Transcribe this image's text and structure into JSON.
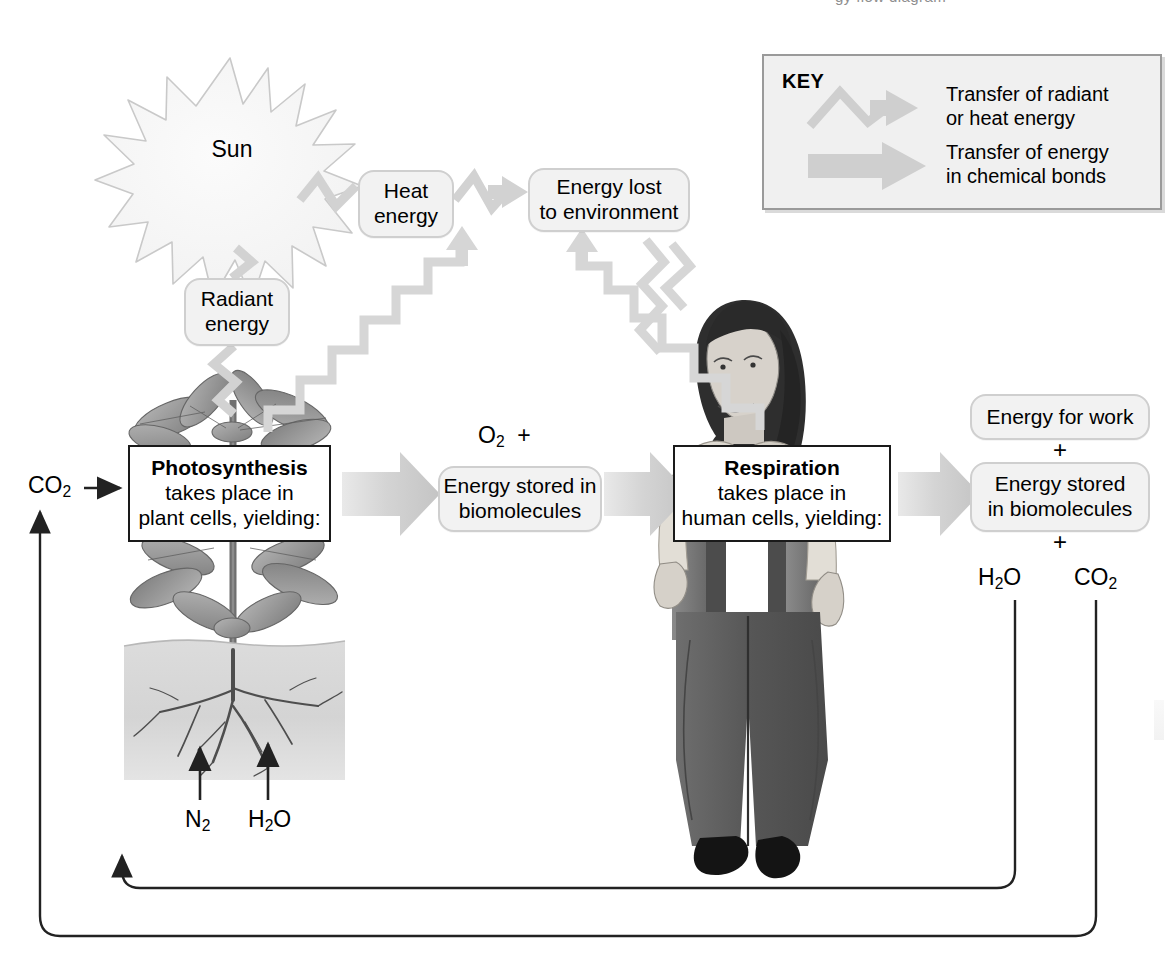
{
  "figure": {
    "title_remnant": "gy flow diagram",
    "bg_color": "#ffffff"
  },
  "key": {
    "title": "KEY",
    "entries": [
      {
        "icon": "zigzag-arrow-icon",
        "label_line1": "Transfer of radiant",
        "label_line2": "or heat energy"
      },
      {
        "icon": "block-arrow-icon",
        "label_line1": "Transfer of energy",
        "label_line2": "in chemical bonds"
      }
    ],
    "panel_color": "#f0f0f0",
    "border_color": "#9a9a9a"
  },
  "nodes": {
    "sun": "Sun",
    "radiant_energy": "Radiant\nenergy",
    "heat_energy_l1": "Heat",
    "heat_energy_l2": "energy",
    "energy_lost_l1": "Energy lost",
    "energy_lost_l2": "to environment",
    "photosynthesis_title": "Photosynthesis",
    "photosynthesis_l2": "takes place in",
    "photosynthesis_l3": "plant cells, yielding:",
    "respiration_title": "Respiration",
    "respiration_l2": "takes place in",
    "respiration_l3": "human cells, yielding:",
    "stored_mid_l1": "Energy stored in",
    "stored_mid_l2": "biomolecules",
    "energy_for_work": "Energy for work",
    "stored_right_l1": "Energy stored",
    "stored_right_l2": "in biomolecules"
  },
  "labels": {
    "co2_input": "CO2",
    "o2_plus": "O2  +",
    "n2_soil": "N2",
    "h2o_soil": "H2O",
    "h2o_output": "H2O",
    "co2_output": "CO2",
    "plus_upper": "+",
    "plus_lower": "+"
  },
  "illustrations": {
    "plant": "plant-illustration",
    "soil": "soil-block-illustration",
    "person": "woman-illustration"
  },
  "colors": {
    "rounded_fill": "#f2f2f2",
    "rounded_stroke": "#cfcfcf",
    "hard_stroke": "#1a1a1a",
    "arrow_gray": "#d2d2d2",
    "zigzag_gray": "#d6d6d6",
    "line_black": "#222222",
    "soil_gray": "#d9d9d9",
    "leaf_gray": "#9a9a9a",
    "cloth_dark": "#5a5a5a",
    "hair_dark": "#2a2a2a"
  }
}
